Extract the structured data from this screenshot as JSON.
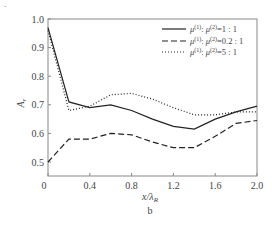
{
  "chart_data": {
    "type": "line",
    "title": "",
    "panel_label": "b",
    "xlabel": "x/λ_R",
    "ylabel": "A_r",
    "xlim": [
      0,
      2.0
    ],
    "ylim": [
      0.45,
      1.0
    ],
    "grid": false,
    "legend_position": "upper right",
    "x_ticks": [
      "0",
      "0.4",
      "0.8",
      "1.2",
      "1.6",
      "2.0"
    ],
    "y_ticks": [
      "0.5",
      "0.6",
      "0.7",
      "0.8",
      "0.9",
      "1.0"
    ],
    "x": [
      0,
      0.2,
      0.4,
      0.6,
      0.8,
      1.0,
      1.2,
      1.4,
      1.6,
      1.8,
      2.0
    ],
    "series": [
      {
        "name": "μ(1): μ(2)=1:1",
        "style": "solid",
        "values": [
          0.97,
          0.71,
          0.69,
          0.7,
          0.68,
          0.65,
          0.625,
          0.615,
          0.65,
          0.675,
          0.695
        ]
      },
      {
        "name": "μ(1): μ(2)=0.2:1",
        "style": "dashed",
        "values": [
          0.5,
          0.58,
          0.58,
          0.6,
          0.595,
          0.57,
          0.55,
          0.55,
          0.59,
          0.635,
          0.645
        ]
      },
      {
        "name": "μ(1): μ(2)=5:1",
        "style": "dotted",
        "values": [
          0.96,
          0.68,
          0.695,
          0.735,
          0.74,
          0.72,
          0.69,
          0.665,
          0.665,
          0.675,
          0.675
        ]
      }
    ]
  },
  "legend": [
    {
      "mu1": "μ",
      "sup1": "(1)",
      "sep": ": ",
      "mu2": "μ",
      "sup2": "(2)",
      "ratio": "=1 : 1"
    },
    {
      "mu1": "μ",
      "sup1": "(1)",
      "sep": ": ",
      "mu2": "μ",
      "sup2": "(2)",
      "ratio": "=0.2 : 1"
    },
    {
      "mu1": "μ",
      "sup1": "(1)",
      "sep": ": ",
      "mu2": "μ",
      "sup2": "(2)",
      "ratio": "=5 : 1"
    }
  ],
  "axes": {
    "xlabel_main": "x/λ",
    "xlabel_sub": "R",
    "ylabel_main": "A",
    "ylabel_sub": "r",
    "panel": "b"
  }
}
